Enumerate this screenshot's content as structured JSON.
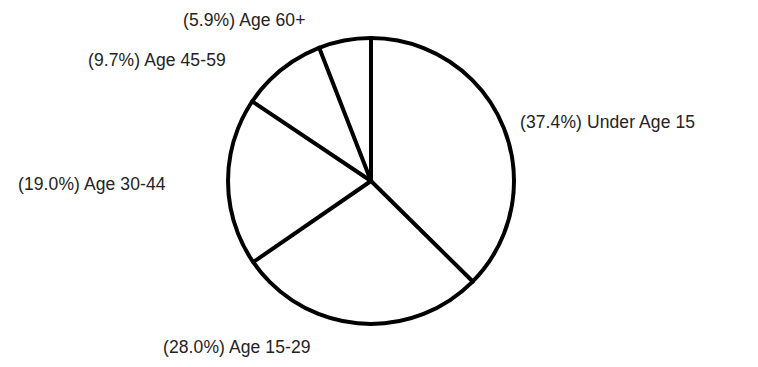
{
  "chart_data": {
    "type": "pie",
    "title": "",
    "subtitle": "",
    "xlabel": "",
    "ylabel": "",
    "legend_position": "none",
    "grid": false,
    "start_angle_deg": 90,
    "direction": "clockwise",
    "total_percent": 100.0,
    "categories": [
      "Under Age 15",
      "Age 15-29",
      "Age 30-44",
      "Age 45-59",
      "Age 60+"
    ],
    "values": [
      37.4,
      28.0,
      19.0,
      9.7,
      5.9
    ],
    "labels": [
      "(37.4%) Under Age 15",
      "(28.0%) Age 15-29",
      "(19.0%) Age 30-44",
      "(9.7%) Age 45-59",
      "(5.9%) Age 60+"
    ],
    "slices": [
      {
        "name": "Under Age 15",
        "percent": 37.4,
        "label": "(37.4%) Under Age 15",
        "angle_deg": 134.6,
        "fill": "#ffffff",
        "stroke": "#000000"
      },
      {
        "name": "Age 15-29",
        "percent": 28.0,
        "label": "(28.0%) Age 15-29",
        "angle_deg": 100.8,
        "fill": "#ffffff",
        "stroke": "#000000"
      },
      {
        "name": "Age 30-44",
        "percent": 19.0,
        "label": "(19.0%) Age 30-44",
        "angle_deg": 68.4,
        "fill": "#ffffff",
        "stroke": "#000000"
      },
      {
        "name": "Age 45-59",
        "percent": 9.7,
        "label": "(9.7%) Age 45-59",
        "angle_deg": 34.9,
        "fill": "#ffffff",
        "stroke": "#000000"
      },
      {
        "name": "Age 60+",
        "percent": 5.9,
        "label": "(5.9%) Age 60+",
        "angle_deg": 21.2,
        "fill": "#ffffff",
        "stroke": "#000000"
      }
    ],
    "colors": {
      "background": "#ffffff",
      "slice_fill": "#ffffff",
      "outline": "#000000",
      "label_text": "#232323"
    },
    "geometry": {
      "center_x": 371,
      "center_y": 181,
      "radius": 143,
      "stroke_width": 4
    }
  }
}
